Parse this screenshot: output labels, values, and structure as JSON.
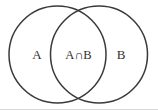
{
  "figure": {
    "background_color": "#ffffff",
    "stroke_color": "#3a3a3c",
    "label_color": "#2f2f31",
    "baseline_rule_color": "#d8d8d8",
    "width": 158,
    "height": 110
  },
  "diagram": {
    "type": "venn",
    "sets": [
      {
        "id": "set-a",
        "label": "A",
        "label_x": 37,
        "label_y": 56,
        "center_x": 57.5,
        "center_y": 54.5,
        "radius": 48.5
      },
      {
        "id": "set-b",
        "label": "B",
        "label_x": 121,
        "label_y": 56,
        "center_x": 99,
        "center_y": 54.5,
        "radius": 48.5
      }
    ],
    "regions": [
      {
        "id": "region-intersection",
        "label": "A∩B",
        "label_x": 78.5,
        "label_y": 56
      }
    ]
  }
}
